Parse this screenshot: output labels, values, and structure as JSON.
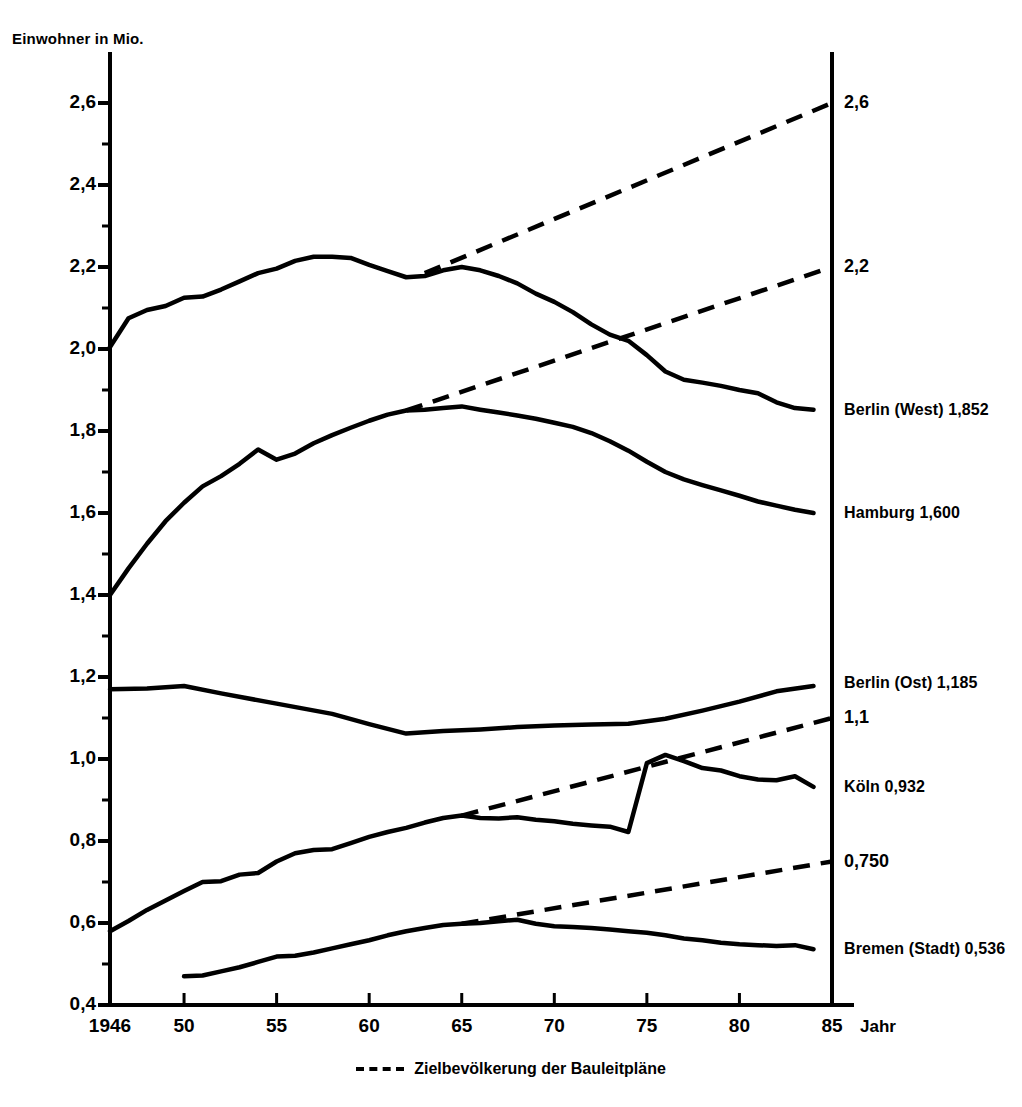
{
  "chart_data": {
    "type": "line",
    "title": "",
    "ylabel": "Einwohner in Mio.",
    "xlabel": "Jahr",
    "xlim": [
      1946,
      85
    ],
    "ylim": [
      0.4,
      2.7
    ],
    "grid": false,
    "legend_position": "bottom-center",
    "yticks": [
      "0,4",
      "0,6",
      "0,8",
      "1,0",
      "1,2",
      "1,4",
      "1,6",
      "1,8",
      "2,0",
      "2,2",
      "2,4",
      "2,6"
    ],
    "ytick_values": [
      0.4,
      0.6,
      0.8,
      1.0,
      1.2,
      1.4,
      1.6,
      1.8,
      2.0,
      2.2,
      2.4,
      2.6
    ],
    "yminor_values": [
      0.5,
      0.7,
      0.9,
      1.1,
      1.3,
      1.5,
      1.7,
      1.9,
      2.1,
      2.3,
      2.5
    ],
    "xticks": [
      "1946",
      "50",
      "55",
      "60",
      "65",
      "70",
      "75",
      "80",
      "85"
    ],
    "xtick_values": [
      1946,
      1950,
      1955,
      1960,
      1965,
      1970,
      1975,
      1980,
      1985
    ],
    "legend": [
      {
        "name": "Zielbevölkerung der Bauleitpläne",
        "style": "dashed"
      }
    ],
    "series": [
      {
        "name": "Berlin (West)",
        "end_label": "Berlin (West) 1,852",
        "end_value": 1.852,
        "style": "solid",
        "x": [
          1946,
          1947,
          1948,
          1949,
          1950,
          1951,
          1952,
          1953,
          1954,
          1955,
          1956,
          1957,
          1958,
          1959,
          1960,
          1961,
          1962,
          1963,
          1964,
          1965,
          1966,
          1967,
          1968,
          1969,
          1970,
          1971,
          1972,
          1973,
          1974,
          1975,
          1976,
          1977,
          1978,
          1979,
          1980,
          1981,
          1982,
          1983,
          1984
        ],
        "y": [
          2.005,
          2.075,
          2.095,
          2.105,
          2.125,
          2.128,
          2.145,
          2.165,
          2.185,
          2.196,
          2.215,
          2.225,
          2.225,
          2.222,
          2.205,
          2.19,
          2.175,
          2.178,
          2.192,
          2.2,
          2.192,
          2.178,
          2.16,
          2.135,
          2.115,
          2.09,
          2.06,
          2.035,
          2.02,
          1.985,
          1.945,
          1.925,
          1.918,
          1.91,
          1.9,
          1.892,
          1.87,
          1.856,
          1.852
        ]
      },
      {
        "name": "Hamburg",
        "end_label": "Hamburg 1,600",
        "end_value": 1.6,
        "style": "solid",
        "x": [
          1946,
          1947,
          1948,
          1949,
          1950,
          1951,
          1952,
          1953,
          1954,
          1955,
          1956,
          1957,
          1958,
          1959,
          1960,
          1961,
          1962,
          1963,
          1964,
          1965,
          1966,
          1967,
          1968,
          1969,
          1970,
          1971,
          1972,
          1973,
          1974,
          1975,
          1976,
          1977,
          1978,
          1979,
          1980,
          1981,
          1982,
          1983,
          1984
        ],
        "y": [
          1.4,
          1.465,
          1.525,
          1.58,
          1.625,
          1.665,
          1.69,
          1.72,
          1.755,
          1.73,
          1.745,
          1.77,
          1.79,
          1.808,
          1.825,
          1.84,
          1.85,
          1.852,
          1.856,
          1.86,
          1.852,
          1.845,
          1.838,
          1.83,
          1.82,
          1.81,
          1.795,
          1.775,
          1.752,
          1.725,
          1.7,
          1.682,
          1.668,
          1.655,
          1.642,
          1.628,
          1.618,
          1.608,
          1.6
        ]
      },
      {
        "name": "Berlin (Ost)",
        "end_label": "Berlin (Ost) 1,185",
        "end_value": 1.185,
        "style": "solid",
        "x": [
          1946,
          1948,
          1950,
          1952,
          1955,
          1958,
          1960,
          1962,
          1964,
          1966,
          1968,
          1970,
          1972,
          1974,
          1976,
          1978,
          1980,
          1982,
          1984
        ],
        "y": [
          1.17,
          1.172,
          1.178,
          1.16,
          1.135,
          1.11,
          1.085,
          1.062,
          1.068,
          1.072,
          1.078,
          1.082,
          1.084,
          1.086,
          1.098,
          1.118,
          1.14,
          1.165,
          1.178
        ]
      },
      {
        "name": "Köln",
        "end_label": "Köln 0,932",
        "end_value": 0.932,
        "style": "solid",
        "x": [
          1946,
          1947,
          1948,
          1949,
          1950,
          1951,
          1952,
          1953,
          1954,
          1955,
          1956,
          1957,
          1958,
          1959,
          1960,
          1961,
          1962,
          1963,
          1964,
          1965,
          1966,
          1967,
          1968,
          1969,
          1970,
          1971,
          1972,
          1973,
          1974,
          1975,
          1976,
          1977,
          1978,
          1979,
          1980,
          1981,
          1982,
          1983,
          1984
        ],
        "y": [
          0.58,
          0.605,
          0.632,
          0.655,
          0.678,
          0.7,
          0.702,
          0.718,
          0.722,
          0.75,
          0.77,
          0.778,
          0.78,
          0.795,
          0.81,
          0.822,
          0.832,
          0.845,
          0.856,
          0.862,
          0.856,
          0.855,
          0.858,
          0.852,
          0.848,
          0.842,
          0.838,
          0.835,
          0.822,
          0.99,
          1.01,
          0.995,
          0.978,
          0.972,
          0.958,
          0.95,
          0.948,
          0.958,
          0.932
        ]
      },
      {
        "name": "Bremen (Stadt)",
        "end_label": "Bremen (Stadt) 0,536",
        "end_value": 0.536,
        "style": "solid",
        "x": [
          1950,
          1951,
          1952,
          1953,
          1954,
          1955,
          1956,
          1957,
          1958,
          1959,
          1960,
          1961,
          1962,
          1963,
          1964,
          1965,
          1966,
          1967,
          1968,
          1969,
          1970,
          1971,
          1972,
          1973,
          1974,
          1975,
          1976,
          1977,
          1978,
          1979,
          1980,
          1981,
          1982,
          1983,
          1984
        ],
        "y": [
          0.47,
          0.472,
          0.482,
          0.492,
          0.505,
          0.518,
          0.52,
          0.528,
          0.538,
          0.548,
          0.558,
          0.57,
          0.58,
          0.588,
          0.595,
          0.598,
          0.6,
          0.604,
          0.608,
          0.598,
          0.592,
          0.59,
          0.588,
          0.584,
          0.58,
          0.576,
          0.57,
          0.562,
          0.558,
          0.552,
          0.548,
          0.546,
          0.544,
          0.546,
          0.536
        ]
      }
    ],
    "target_lines": [
      {
        "name": "Zielbevölkerung Berlin (West)",
        "label": "2,6",
        "x": [
          1963,
          1985
        ],
        "y": [
          2.185,
          2.6
        ],
        "style": "dashed"
      },
      {
        "name": "Zielbevölkerung Hamburg",
        "label": "2,2",
        "x": [
          1962,
          1985
        ],
        "y": [
          1.85,
          2.2
        ],
        "style": "dashed"
      },
      {
        "name": "Zielbevölkerung Köln",
        "label": "1,1",
        "x": [
          1965,
          1985
        ],
        "y": [
          0.862,
          1.1
        ],
        "style": "dashed"
      },
      {
        "name": "Zielbevölkerung Bremen (Stadt)",
        "label": "0,750",
        "x": [
          1965,
          1985
        ],
        "y": [
          0.598,
          0.75
        ],
        "style": "dashed"
      }
    ]
  }
}
